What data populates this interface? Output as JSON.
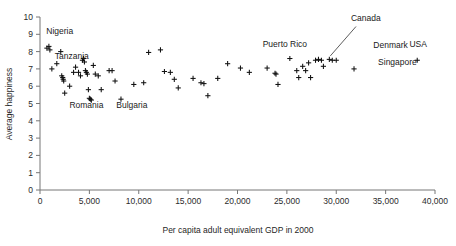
{
  "chart_data": {
    "type": "scatter",
    "title": "",
    "xlabel": "Per capita adult equivalent GDP in 2000",
    "ylabel": "Average happiness",
    "xlim": [
      0,
      40000
    ],
    "ylim": [
      0,
      10
    ],
    "grid": false,
    "legend": null,
    "marker_style": "plus",
    "xticks": [
      0,
      5000,
      10000,
      15000,
      20000,
      25000,
      30000,
      35000,
      40000
    ],
    "xtick_labels": [
      "0",
      "5,000",
      "10,000",
      "15,000",
      "20,000",
      "25,000",
      "30,000",
      "35,000",
      "40,000"
    ],
    "yticks": [
      0,
      1,
      2,
      3,
      4,
      5,
      6,
      7,
      8,
      9,
      10
    ],
    "ytick_labels": [
      "0",
      "1",
      "2",
      "3",
      "4",
      "5",
      "6",
      "7",
      "8",
      "9",
      "10"
    ],
    "points": [
      {
        "x": 700,
        "y": 8.2
      },
      {
        "x": 900,
        "y": 8.3
      },
      {
        "x": 1000,
        "y": 8.1
      },
      {
        "x": 1200,
        "y": 7.0
      },
      {
        "x": 1700,
        "y": 7.3
      },
      {
        "x": 2100,
        "y": 8.0
      },
      {
        "x": 2200,
        "y": 6.6
      },
      {
        "x": 2300,
        "y": 6.5
      },
      {
        "x": 2350,
        "y": 6.4
      },
      {
        "x": 2400,
        "y": 6.3
      },
      {
        "x": 2500,
        "y": 5.6
      },
      {
        "x": 3000,
        "y": 6.0
      },
      {
        "x": 3400,
        "y": 6.8
      },
      {
        "x": 3600,
        "y": 7.1
      },
      {
        "x": 3900,
        "y": 6.8
      },
      {
        "x": 4100,
        "y": 6.6
      },
      {
        "x": 4300,
        "y": 7.5
      },
      {
        "x": 4400,
        "y": 7.6
      },
      {
        "x": 4500,
        "y": 7.4
      },
      {
        "x": 4600,
        "y": 6.9
      },
      {
        "x": 4700,
        "y": 6.8
      },
      {
        "x": 4800,
        "y": 6.7
      },
      {
        "x": 4900,
        "y": 5.8
      },
      {
        "x": 5000,
        "y": 5.3
      },
      {
        "x": 5100,
        "y": 5.25
      },
      {
        "x": 5200,
        "y": 5.2
      },
      {
        "x": 5400,
        "y": 7.2
      },
      {
        "x": 5600,
        "y": 6.7
      },
      {
        "x": 5900,
        "y": 6.6
      },
      {
        "x": 6200,
        "y": 5.8
      },
      {
        "x": 7000,
        "y": 6.9
      },
      {
        "x": 7300,
        "y": 6.9
      },
      {
        "x": 7600,
        "y": 6.3
      },
      {
        "x": 8200,
        "y": 5.25
      },
      {
        "x": 9500,
        "y": 6.1
      },
      {
        "x": 10500,
        "y": 6.2
      },
      {
        "x": 11000,
        "y": 7.95
      },
      {
        "x": 12200,
        "y": 8.1
      },
      {
        "x": 12600,
        "y": 6.85
      },
      {
        "x": 13200,
        "y": 6.8
      },
      {
        "x": 13600,
        "y": 6.4
      },
      {
        "x": 14000,
        "y": 5.9
      },
      {
        "x": 15500,
        "y": 6.45
      },
      {
        "x": 16300,
        "y": 6.2
      },
      {
        "x": 16600,
        "y": 6.15
      },
      {
        "x": 17000,
        "y": 5.45
      },
      {
        "x": 18000,
        "y": 6.45
      },
      {
        "x": 19000,
        "y": 7.3
      },
      {
        "x": 20300,
        "y": 7.05
      },
      {
        "x": 21200,
        "y": 6.8
      },
      {
        "x": 23000,
        "y": 7.05
      },
      {
        "x": 23800,
        "y": 6.75
      },
      {
        "x": 23900,
        "y": 6.7
      },
      {
        "x": 24100,
        "y": 6.1
      },
      {
        "x": 25300,
        "y": 7.6
      },
      {
        "x": 26000,
        "y": 6.9
      },
      {
        "x": 26200,
        "y": 6.5
      },
      {
        "x": 26600,
        "y": 7.15
      },
      {
        "x": 26900,
        "y": 6.9
      },
      {
        "x": 27200,
        "y": 7.35
      },
      {
        "x": 27400,
        "y": 6.5
      },
      {
        "x": 27900,
        "y": 7.5
      },
      {
        "x": 28200,
        "y": 7.55
      },
      {
        "x": 28500,
        "y": 7.5
      },
      {
        "x": 28700,
        "y": 7.15
      },
      {
        "x": 29300,
        "y": 7.55
      },
      {
        "x": 29600,
        "y": 7.5
      },
      {
        "x": 30000,
        "y": 7.5
      },
      {
        "x": 31800,
        "y": 7.0
      },
      {
        "x": 38200,
        "y": 7.5
      }
    ],
    "annotations": [
      {
        "label": "Nigeria",
        "x": 2000,
        "y": 9.0,
        "anchor": "middle",
        "leader": false
      },
      {
        "label": "Tanzania",
        "x": 1500,
        "y": 7.55,
        "anchor": "start",
        "leader": false
      },
      {
        "label": "Romania",
        "x": 4700,
        "y": 4.75,
        "anchor": "middle",
        "leader": false
      },
      {
        "label": "Bulgaria",
        "x": 9300,
        "y": 4.75,
        "anchor": "middle",
        "leader": false
      },
      {
        "label": "Puerto Rico",
        "x": 24800,
        "y": 8.25,
        "anchor": "middle",
        "leader": false
      },
      {
        "label": "Canada",
        "x": 33000,
        "y": 9.75,
        "anchor": "middle",
        "leader": true,
        "leader_from": {
          "x": 32000,
          "y": 9.45
        },
        "leader_to": {
          "x": 29400,
          "y": 7.75
        }
      },
      {
        "label": "Denmark",
        "x": 35500,
        "y": 8.2,
        "anchor": "middle",
        "leader": false
      },
      {
        "label": "Singapore",
        "x": 36200,
        "y": 7.25,
        "anchor": "middle",
        "leader": false
      },
      {
        "label": "USA",
        "x": 38300,
        "y": 8.25,
        "anchor": "middle",
        "leader": false
      }
    ]
  },
  "geometry": {
    "plot_left_px": 40,
    "plot_right_px": 435,
    "plot_top_px": 17,
    "plot_bottom_px": 190
  }
}
